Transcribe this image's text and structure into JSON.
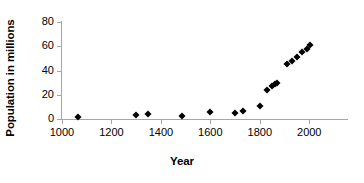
{
  "chart_data": {
    "type": "scatter",
    "title": "",
    "xlabel": "Year",
    "ylabel": "Population in millions",
    "xlim": [
      1000,
      2100
    ],
    "ylim": [
      0,
      80
    ],
    "grid": false,
    "legend": false,
    "marker": "diamond",
    "marker_color": "#000000",
    "axis_color": "#a6a6a6",
    "xticks": [
      1000,
      1200,
      1400,
      1600,
      1800,
      2000
    ],
    "xtick_labels": [
      "1000",
      "1200",
      "1400",
      "1600",
      "1800",
      "2000"
    ],
    "yticks": [
      0,
      20,
      40,
      60,
      80
    ],
    "ytick_labels": [
      "0",
      "20",
      "40",
      "60",
      "80"
    ],
    "points": [
      {
        "x": 1066,
        "y": 1.3
      },
      {
        "x": 1300,
        "y": 3.0
      },
      {
        "x": 1348,
        "y": 4.3
      },
      {
        "x": 1485,
        "y": 2.2
      },
      {
        "x": 1600,
        "y": 6.0
      },
      {
        "x": 1700,
        "y": 5.2
      },
      {
        "x": 1730,
        "y": 6.6
      },
      {
        "x": 1801,
        "y": 10.7
      },
      {
        "x": 1831,
        "y": 24.0
      },
      {
        "x": 1851,
        "y": 27.5
      },
      {
        "x": 1861,
        "y": 28.9
      },
      {
        "x": 1871,
        "y": 29.5
      },
      {
        "x": 1911,
        "y": 45.5
      },
      {
        "x": 1931,
        "y": 48.0
      },
      {
        "x": 1951,
        "y": 51.0
      },
      {
        "x": 1971,
        "y": 55.5
      },
      {
        "x": 1991,
        "y": 57.8
      },
      {
        "x": 2001,
        "y": 61.0
      }
    ]
  }
}
